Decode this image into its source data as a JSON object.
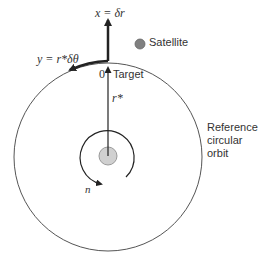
{
  "diagram": {
    "labels": {
      "x_axis": "x = δr",
      "y_axis": "y = r*δθ",
      "origin": "0",
      "target": "Target",
      "satellite": "Satellite",
      "radius": "r*",
      "mean_motion": "n",
      "orbit_line1": "Reference",
      "orbit_line2": "circular",
      "orbit_line3": "orbit"
    },
    "colors": {
      "line": "#222222",
      "orbit": "#555555",
      "satellite_fill": "#808080",
      "planet_fill": "#d0d0d0",
      "planet_stroke": "#9a9a9a",
      "text": "#333333"
    }
  }
}
